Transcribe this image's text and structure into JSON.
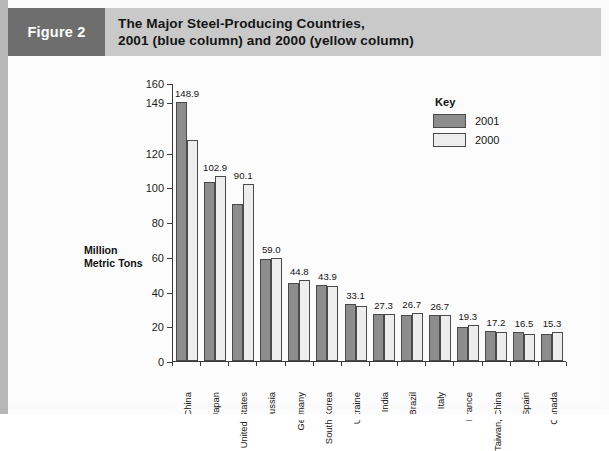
{
  "figure": {
    "tag": "Figure 2",
    "title_line1": "The Major Steel-Producing Countries,",
    "title_line2": "2001 (blue column) and 2000 (yellow column)",
    "tag_bg": "#6e6e6e",
    "header_bg": "#c9c9c9"
  },
  "legend": {
    "title": "Key",
    "items": [
      {
        "label": "2001",
        "color": "#8d8d8d"
      },
      {
        "label": "2000",
        "color": "#ededed"
      }
    ]
  },
  "axis": {
    "y_title_line1": "Million",
    "y_title_line2": "Metric Tons",
    "y_ticks": [
      "0",
      "20",
      "40",
      "60",
      "80",
      "100",
      "120",
      "149",
      "160"
    ]
  },
  "chart_data": {
    "type": "bar",
    "title": "The Major Steel-Producing Countries, 2001 (blue column) and 2000 (yellow column)",
    "xlabel": "",
    "ylabel": "Million Metric Tons",
    "ylim": [
      0,
      160
    ],
    "ytick_values": [
      0,
      20,
      40,
      60,
      80,
      100,
      120,
      149,
      160
    ],
    "ytick_labels": [
      "0",
      "20",
      "40",
      "60",
      "80",
      "100",
      "120",
      "149",
      "160"
    ],
    "grid": false,
    "legend_position": "upper-right",
    "categories": [
      "China",
      "Japan",
      "United States",
      "Russia",
      "Germany",
      "South Korea",
      "Ukraine",
      "India",
      "Brazil",
      "Italy",
      "France",
      "Taiwan, China",
      "Spain",
      "Canada"
    ],
    "series": [
      {
        "name": "2001",
        "color": "#8d8d8d",
        "values": [
          148.9,
          102.9,
          90.1,
          59.0,
          44.8,
          43.9,
          33.1,
          27.3,
          26.7,
          26.7,
          19.3,
          17.2,
          16.5,
          15.3
        ]
      },
      {
        "name": "2000",
        "color": "#ededed",
        "values": [
          127.2,
          106.4,
          101.8,
          59.1,
          46.4,
          43.1,
          31.8,
          26.9,
          27.9,
          26.5,
          21.0,
          16.8,
          15.8,
          16.6
        ]
      }
    ],
    "data_labels": [
      "148.9",
      "102.9",
      "90.1",
      "59.0",
      "44.8",
      "43.9",
      "33.1",
      "27.3",
      "26.7",
      "26.7",
      "19.3",
      "17.2",
      "16.5",
      "15.3"
    ],
    "data_label_note": "Labels shown above each country's pair correspond to the 2001 series."
  },
  "source": {
    "text": "Source line cropped at image edge"
  }
}
